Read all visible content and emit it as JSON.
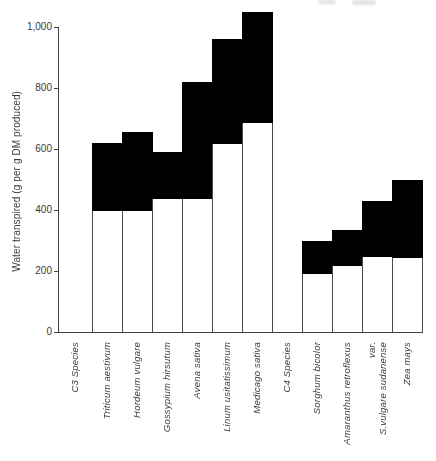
{
  "chart_data": {
    "type": "bar",
    "subtype": "floating-range-bars",
    "title": "",
    "ylabel": "Water transpired (g per g DM produced)",
    "xlabel": "",
    "ylim": [
      0,
      1000
    ],
    "grid": false,
    "legend": null,
    "y_axis": {
      "ticks": [
        0,
        200,
        400,
        600,
        800,
        1000
      ],
      "tick_labels": [
        "0",
        "200",
        "400",
        "600",
        "800",
        "1,000"
      ]
    },
    "colors": {
      "upper_range_fill": "#000000",
      "lower_range_fill": "#ffffff",
      "axis_line": "#3f3f3f",
      "text": "#3a3a3a",
      "background": "#ffffff"
    },
    "items": [
      {
        "label": "C3 Species",
        "group_header": true
      },
      {
        "label": "Triticum aestivum",
        "range_low": 400,
        "range_high": 620
      },
      {
        "label": "Hordeum vulgare",
        "range_low": 400,
        "range_high": 655
      },
      {
        "label": "Gossypium hirsutum",
        "range_low": 440,
        "range_high": 590
      },
      {
        "label": "Avena sativa",
        "range_low": 440,
        "range_high": 820
      },
      {
        "label": "Linum usitatissimum",
        "range_low": 620,
        "range_high": 960
      },
      {
        "label": "Medicago sativa",
        "range_low": 690,
        "range_high": 1050
      },
      {
        "label": "C4 Species",
        "group_header": true
      },
      {
        "label": "Sorghum bicolor",
        "range_low": 195,
        "range_high": 300
      },
      {
        "label": "Amaranthus retroflexus",
        "range_low": 220,
        "range_high": 335
      },
      {
        "label": "var.\nS.vulgare sudanense",
        "range_low": 250,
        "range_high": 430
      },
      {
        "label": "Zea mays",
        "range_low": 245,
        "range_high": 500
      }
    ]
  }
}
